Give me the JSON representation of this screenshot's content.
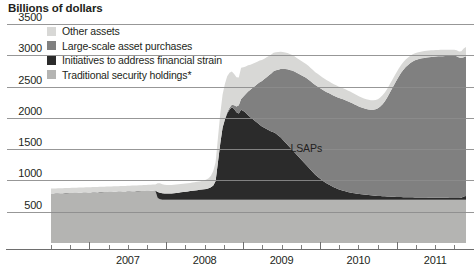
{
  "chart_data": {
    "type": "area",
    "stacked": true,
    "title": "Billions of dollars",
    "xlabel": "",
    "ylabel": "Billions of dollars",
    "ylim": [
      0,
      3500
    ],
    "xlim": [
      2006.5,
      2011.9
    ],
    "grid": true,
    "legend_position": "top-left-inside",
    "y_ticks": [
      3500,
      3000,
      2500,
      2000,
      1500,
      1000,
      500
    ],
    "x_ticks": [
      2007,
      2008,
      2009,
      2010,
      2011
    ],
    "x_minor_ticks_per_year": 4,
    "annotations": [
      {
        "text": "LSAPs",
        "x": 2009.85,
        "y": 1500
      }
    ],
    "footnote_marker": "*",
    "colors": {
      "other_assets": "#d8d8d6",
      "lsaps": "#808080",
      "initiatives": "#2b2b2b",
      "traditional": "#b4b4b2",
      "gridline": "#8c8c8c",
      "axis": "#6e6e6e",
      "text": "#231f20"
    },
    "series": [
      {
        "name": "Traditional security holdings*",
        "key": "traditional",
        "color": "#b4b4b2",
        "order": 1,
        "values": [
          790,
          791,
          792,
          793,
          794,
          795,
          796,
          797,
          798,
          799,
          800,
          801,
          802,
          803,
          804,
          805,
          806,
          807,
          808,
          809,
          810,
          812,
          813,
          814,
          815,
          816,
          817,
          818,
          819,
          820,
          821,
          822,
          823,
          824,
          825,
          826,
          827,
          828,
          829,
          830,
          831,
          832,
          833,
          834,
          835,
          836,
          720,
          700,
          690,
          690,
          690,
          690,
          690,
          690,
          690,
          690,
          690,
          690,
          690,
          690,
          690,
          690,
          690,
          690,
          690,
          690,
          690,
          690,
          690,
          690,
          690,
          690,
          690,
          690,
          690,
          690,
          690,
          690,
          690,
          690,
          690,
          690,
          690,
          690,
          690,
          690,
          690,
          690,
          690,
          690,
          690,
          690,
          690,
          690,
          690,
          690,
          690,
          690,
          690,
          690,
          690,
          690,
          690,
          690,
          690,
          690,
          690,
          690,
          690,
          690,
          690,
          690,
          690,
          690,
          690,
          690,
          690,
          690,
          690,
          690,
          690,
          690,
          690,
          690,
          690,
          690,
          690,
          690,
          690,
          690,
          690,
          690,
          690,
          690,
          690,
          690,
          690,
          690,
          690,
          690,
          690,
          690,
          690,
          690,
          690,
          690,
          690,
          690,
          690,
          690,
          690,
          690,
          690,
          690,
          690,
          690,
          690,
          690,
          690,
          690,
          690,
          690,
          690,
          690,
          690,
          690,
          690,
          690,
          690,
          690,
          690,
          690,
          690,
          690,
          690,
          690,
          690,
          690,
          690,
          690
        ]
      },
      {
        "name": "Initiatives to address financial strain",
        "key": "initiatives",
        "color": "#2b2b2b",
        "order": 2,
        "values": [
          2,
          2,
          2,
          2,
          2,
          2,
          2,
          2,
          2,
          2,
          2,
          2,
          2,
          2,
          2,
          2,
          2,
          2,
          2,
          2,
          2,
          2,
          2,
          2,
          2,
          2,
          2,
          2,
          2,
          2,
          2,
          2,
          2,
          2,
          2,
          2,
          2,
          2,
          2,
          2,
          2,
          2,
          2,
          2,
          2,
          2,
          95,
          105,
          105,
          100,
          100,
          100,
          100,
          105,
          110,
          115,
          120,
          125,
          130,
          135,
          140,
          145,
          150,
          155,
          160,
          165,
          170,
          175,
          185,
          200,
          230,
          300,
          600,
          900,
          1150,
          1280,
          1380,
          1440,
          1480,
          1450,
          1400,
          1380,
          1440,
          1420,
          1390,
          1350,
          1320,
          1290,
          1260,
          1230,
          1200,
          1170,
          1150,
          1130,
          1110,
          1090,
          1080,
          1060,
          1030,
          1000,
          960,
          920,
          880,
          840,
          800,
          760,
          720,
          680,
          640,
          600,
          560,
          520,
          480,
          440,
          400,
          370,
          340,
          310,
          285,
          260,
          240,
          220,
          200,
          185,
          170,
          158,
          146,
          136,
          126,
          118,
          110,
          104,
          98,
          92,
          88,
          84,
          80,
          76,
          72,
          69,
          66,
          63,
          60,
          58,
          56,
          54,
          52,
          50,
          48,
          46,
          45,
          44,
          43,
          42,
          41,
          40,
          40,
          39,
          38,
          38,
          37,
          36,
          36,
          35,
          35,
          34,
          34,
          33,
          33,
          32,
          32,
          32,
          31,
          31,
          31,
          30,
          30,
          35,
          55,
          62
        ]
      },
      {
        "name": "Large-scale asset purchases",
        "key": "lsaps",
        "color": "#808080",
        "order": 3,
        "values": [
          0,
          0,
          0,
          0,
          0,
          0,
          0,
          0,
          0,
          0,
          0,
          0,
          0,
          0,
          0,
          0,
          0,
          0,
          0,
          0,
          0,
          0,
          0,
          0,
          0,
          0,
          0,
          0,
          0,
          0,
          0,
          0,
          0,
          0,
          0,
          0,
          0,
          0,
          0,
          0,
          0,
          0,
          0,
          0,
          0,
          0,
          0,
          0,
          0,
          0,
          0,
          0,
          0,
          0,
          0,
          0,
          0,
          0,
          0,
          0,
          0,
          0,
          0,
          0,
          0,
          0,
          0,
          0,
          0,
          0,
          0,
          0,
          0,
          0,
          0,
          10,
          20,
          30,
          40,
          60,
          90,
          130,
          170,
          230,
          300,
          380,
          440,
          500,
          560,
          620,
          680,
          730,
          780,
          830,
          880,
          930,
          975,
          1010,
          1050,
          1090,
          1130,
          1170,
          1205,
          1235,
          1265,
          1290,
          1310,
          1330,
          1350,
          1370,
          1390,
          1405,
          1415,
          1425,
          1435,
          1442,
          1448,
          1452,
          1456,
          1460,
          1462,
          1463,
          1464,
          1464,
          1463,
          1462,
          1460,
          1456,
          1450,
          1442,
          1432,
          1420,
          1408,
          1396,
          1386,
          1378,
          1372,
          1368,
          1368,
          1372,
          1382,
          1400,
          1430,
          1470,
          1520,
          1580,
          1650,
          1720,
          1790,
          1860,
          1925,
          1985,
          2035,
          2080,
          2115,
          2145,
          2170,
          2190,
          2205,
          2215,
          2225,
          2232,
          2238,
          2243,
          2248,
          2252,
          2256,
          2260,
          2262,
          2264,
          2266,
          2268,
          2270,
          2272,
          2272,
          2265,
          2245,
          2230,
          2225,
          2232
        ]
      },
      {
        "name": "Other assets",
        "key": "other_assets",
        "color": "#d8d8d6",
        "order": 4,
        "values": [
          78,
          78,
          78,
          79,
          79,
          79,
          80,
          80,
          80,
          80,
          81,
          81,
          81,
          81,
          82,
          82,
          82,
          82,
          83,
          83,
          83,
          83,
          84,
          84,
          84,
          85,
          85,
          85,
          86,
          86,
          86,
          87,
          87,
          88,
          88,
          89,
          89,
          90,
          90,
          91,
          92,
          93,
          94,
          95,
          96,
          98,
          140,
          150,
          145,
          140,
          138,
          136,
          135,
          134,
          133,
          132,
          131,
          130,
          130,
          130,
          130,
          131,
          132,
          133,
          134,
          136,
          140,
          148,
          160,
          185,
          230,
          300,
          390,
          470,
          530,
          560,
          575,
          560,
          530,
          500,
          470,
          445,
          500,
          470,
          440,
          420,
          400,
          385,
          370,
          358,
          346,
          336,
          326,
          318,
          310,
          303,
          296,
          290,
          284,
          278,
          272,
          266,
          260,
          254,
          248,
          243,
          238,
          233,
          228,
          224,
          220,
          216,
          212,
          208,
          205,
          202,
          199,
          196,
          193,
          190,
          188,
          186,
          184,
          182,
          180,
          178,
          176,
          174,
          172,
          170,
          168,
          166,
          164,
          162,
          160,
          158,
          156,
          154,
          152,
          150,
          148,
          146,
          144,
          142,
          140,
          138,
          136,
          134,
          132,
          130,
          128,
          126,
          124,
          122,
          120,
          118,
          116,
          114,
          112,
          111,
          110,
          109,
          108,
          107,
          106,
          105,
          104,
          103,
          102,
          101,
          100,
          99,
          98,
          97,
          96,
          95,
          94,
          110,
          140,
          150
        ]
      }
    ]
  },
  "legend": {
    "items": [
      {
        "label": "Other assets",
        "color": "#d8d8d6"
      },
      {
        "label": "Large-scale asset purchases",
        "color": "#808080"
      },
      {
        "label": "Initiatives to address financial strain",
        "color": "#2b2b2b"
      },
      {
        "label": "Traditional security holdings*",
        "color": "#b4b4b2"
      }
    ]
  }
}
